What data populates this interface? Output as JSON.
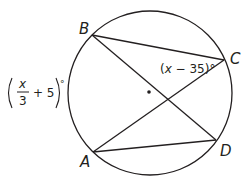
{
  "diagram": {
    "type": "inscribed-angles-circle",
    "stroke_color": "#231f20",
    "points": [
      {
        "id": "A",
        "label": "A"
      },
      {
        "id": "B",
        "label": "B"
      },
      {
        "id": "C",
        "label": "C"
      },
      {
        "id": "D",
        "label": "D"
      }
    ],
    "segments": [
      "BC",
      "BD",
      "CA",
      "AD"
    ],
    "angle_labels": {
      "angle_BCA": {
        "open": "(",
        "var": "x",
        "rest": " − 35)°"
      },
      "arc_AB": {
        "numerator": "x",
        "denominator": "3",
        "rest": "+ 5",
        "degree": "°"
      }
    },
    "center_dot": true
  }
}
